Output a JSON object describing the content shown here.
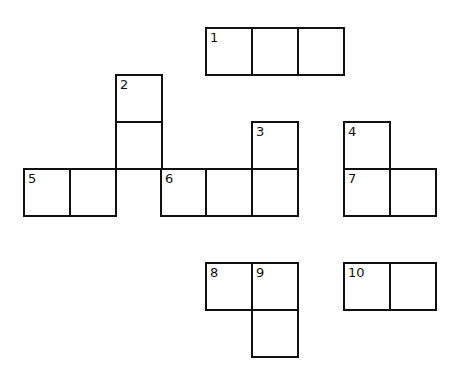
{
  "puzzle": {
    "type": "crossword",
    "border_color": "#111111",
    "background": "#ffffff",
    "cells": [
      {
        "x": 205,
        "y": 27,
        "num": "1"
      },
      {
        "x": 251,
        "y": 27,
        "num": ""
      },
      {
        "x": 297,
        "y": 27,
        "num": ""
      },
      {
        "x": 115,
        "y": 74,
        "num": "2"
      },
      {
        "x": 115,
        "y": 121,
        "num": ""
      },
      {
        "x": 115,
        "y": 168,
        "num": "",
        "open_bottom": true
      },
      {
        "x": 251,
        "y": 121,
        "num": "3"
      },
      {
        "x": 343,
        "y": 121,
        "num": "4"
      },
      {
        "x": 23,
        "y": 168,
        "num": "5"
      },
      {
        "x": 69,
        "y": 168,
        "num": ""
      },
      {
        "x": 160,
        "y": 168,
        "num": "6"
      },
      {
        "x": 205,
        "y": 168,
        "num": ""
      },
      {
        "x": 251,
        "y": 168,
        "num": ""
      },
      {
        "x": 343,
        "y": 168,
        "num": "7"
      },
      {
        "x": 389,
        "y": 168,
        "num": ""
      },
      {
        "x": 205,
        "y": 262,
        "num": "8"
      },
      {
        "x": 251,
        "y": 262,
        "num": "9"
      },
      {
        "x": 251,
        "y": 309,
        "num": ""
      },
      {
        "x": 343,
        "y": 262,
        "num": "10"
      },
      {
        "x": 389,
        "y": 262,
        "num": ""
      }
    ]
  }
}
